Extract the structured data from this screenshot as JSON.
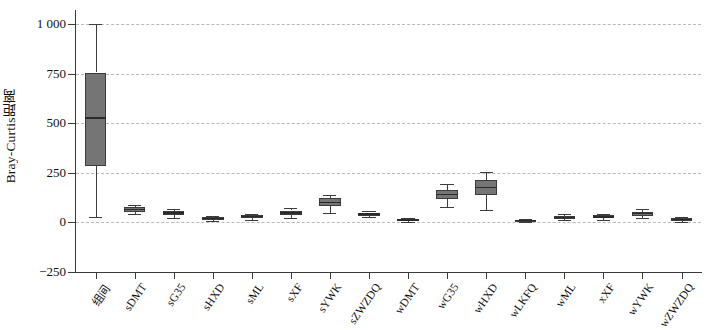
{
  "chart_data": {
    "type": "box",
    "title": "",
    "xlabel": "",
    "ylabel": "Bray-Curtis距离",
    "ylim": [
      -250,
      1070
    ],
    "yticks": [
      -250,
      0,
      250,
      500,
      750,
      1000
    ],
    "ytick_labels": [
      "−250",
      "0",
      "250",
      "500",
      "750",
      "1 000"
    ],
    "grid": "horizontal-dashed",
    "legend": "none",
    "box_fill_color": "#757575",
    "box_edge_color": "#3c3c3c",
    "grid_color": "#b9b9b9",
    "categories": [
      "组间",
      "sDMT",
      "sG35",
      "sHXD",
      "sML",
      "sXF",
      "sYWK",
      "sZWZDQ",
      "wDMT",
      "wG35",
      "wHXD",
      "wLKFQ",
      "wML",
      "xXF",
      "wYWK",
      "wZWZDQ"
    ],
    "boxes": [
      {
        "label": "组间",
        "whisker_low": 25,
        "q1": 285,
        "median": 525,
        "q3": 755,
        "whisker_high": 1000
      },
      {
        "label": "sDMT",
        "whisker_low": 40,
        "q1": 52,
        "median": 66,
        "q3": 78,
        "whisker_high": 90
      },
      {
        "label": "sG35",
        "whisker_low": 22,
        "q1": 38,
        "median": 48,
        "q3": 58,
        "whisker_high": 70
      },
      {
        "label": "sHXD",
        "whisker_low": 8,
        "q1": 14,
        "median": 20,
        "q3": 26,
        "whisker_high": 32
      },
      {
        "label": "sML",
        "whisker_low": 14,
        "q1": 22,
        "median": 30,
        "q3": 37,
        "whisker_high": 44
      },
      {
        "label": "sXF",
        "whisker_low": 22,
        "q1": 38,
        "median": 48,
        "q3": 60,
        "whisker_high": 74
      },
      {
        "label": "sYWK",
        "whisker_low": 48,
        "q1": 82,
        "median": 100,
        "q3": 122,
        "whisker_high": 140
      },
      {
        "label": "sZWZDQ",
        "whisker_low": 26,
        "q1": 34,
        "median": 42,
        "q3": 50,
        "whisker_high": 58
      },
      {
        "label": "wDMT",
        "whisker_low": 4,
        "q1": 9,
        "median": 13,
        "q3": 18,
        "whisker_high": 24
      },
      {
        "label": "wG35",
        "whisker_low": 78,
        "q1": 118,
        "median": 140,
        "q3": 165,
        "whisker_high": 196
      },
      {
        "label": "wHXD",
        "whisker_low": 62,
        "q1": 140,
        "median": 175,
        "q3": 215,
        "whisker_high": 252
      },
      {
        "label": "wLKFQ",
        "whisker_low": 2,
        "q1": 6,
        "median": 10,
        "q3": 14,
        "whisker_high": 19
      },
      {
        "label": "wML",
        "whisker_low": 10,
        "q1": 18,
        "median": 24,
        "q3": 31,
        "whisker_high": 40
      },
      {
        "label": "xXF",
        "whisker_low": 12,
        "q1": 22,
        "median": 28,
        "q3": 35,
        "whisker_high": 44
      },
      {
        "label": "wYWK",
        "whisker_low": 20,
        "q1": 34,
        "median": 44,
        "q3": 54,
        "whisker_high": 66
      },
      {
        "label": "wZWZDQ",
        "whisker_low": 4,
        "q1": 10,
        "median": 15,
        "q3": 20,
        "whisker_high": 26
      }
    ]
  }
}
